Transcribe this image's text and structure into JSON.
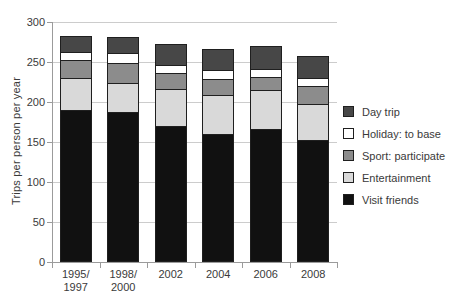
{
  "chart_data": {
    "type": "bar",
    "stacked": true,
    "title": "",
    "xlabel": "",
    "ylabel": "Trips per person per year",
    "ylim": [
      0,
      300
    ],
    "yticks": [
      0,
      50,
      100,
      150,
      200,
      250,
      300
    ],
    "grid": true,
    "legend_position": "right",
    "categories": [
      "1995/\n1997",
      "1998/\n2000",
      "2002",
      "2004",
      "2006",
      "2008"
    ],
    "series": [
      {
        "name": "Visit friends",
        "color": "#111111",
        "values": [
          190,
          188,
          170,
          160,
          166,
          153
        ]
      },
      {
        "name": "Entertainment",
        "color": "#d9d9d9",
        "values": [
          40,
          36,
          46,
          49,
          49,
          44
        ]
      },
      {
        "name": "Sport: participate",
        "color": "#8c8c8c",
        "values": [
          23,
          25,
          20,
          20,
          16,
          23
        ]
      },
      {
        "name": "Holiday: to base",
        "color": "#ffffff",
        "values": [
          9,
          12,
          10,
          11,
          10,
          10
        ]
      },
      {
        "name": "Day trip",
        "color": "#474747",
        "values": [
          21,
          20,
          27,
          26,
          29,
          28
        ]
      }
    ],
    "stack_totals": [
      283,
      281,
      273,
      266,
      270,
      258
    ],
    "legend_order": [
      "Day trip",
      "Holiday: to base",
      "Sport: participate",
      "Entertainment",
      "Visit friends"
    ]
  },
  "colors": {
    "background": "#ffffff",
    "gridline": "#cccccc",
    "axis": "#9b9b9b",
    "text": "#3a3a3a",
    "segment_border": "#1f1f1f"
  }
}
